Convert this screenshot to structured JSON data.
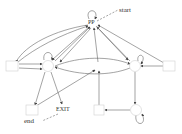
{
  "diagram": {
    "type": "state-transition-graph",
    "colors": {
      "edge": "#555555",
      "node_stroke": "#cccccc",
      "text": "#333333"
    },
    "nodes": [
      {
        "id": "PP",
        "label": "PP",
        "shape": "point",
        "x": 92,
        "y": 22
      },
      {
        "id": "left_box",
        "label": "",
        "shape": "box",
        "x": 12,
        "y": 66
      },
      {
        "id": "left_circle",
        "label": "",
        "shape": "circle",
        "x": 48,
        "y": 66
      },
      {
        "id": "center",
        "label": "",
        "shape": "point",
        "x": 98,
        "y": 66
      },
      {
        "id": "right_circle",
        "label": "",
        "shape": "circle",
        "x": 135,
        "y": 66
      },
      {
        "id": "right_box",
        "label": "",
        "shape": "box",
        "x": 168,
        "y": 66
      },
      {
        "id": "bottom_left_box",
        "label": "",
        "shape": "box",
        "x": 32,
        "y": 110
      },
      {
        "id": "EXIT",
        "label": "EXIT",
        "shape": "text",
        "x": 62,
        "y": 109
      },
      {
        "id": "bottom_mid_box",
        "label": "",
        "shape": "box",
        "x": 99,
        "y": 110
      },
      {
        "id": "bottom_right_circle",
        "label": "",
        "shape": "circle",
        "x": 137,
        "y": 110
      }
    ],
    "annotations": [
      {
        "label": "start",
        "x": 120,
        "y": 9
      },
      {
        "label": "end",
        "x": 10,
        "y": 121
      }
    ],
    "labels": {
      "pp": "PP",
      "start": "start",
      "exit": "EXIT",
      "end": "end"
    }
  }
}
